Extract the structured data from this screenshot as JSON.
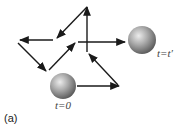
{
  "figure": {
    "panel_label": "(a)",
    "start_label": "t=0",
    "end_label": "t=t′",
    "colors": {
      "arrow": "#1a1a1a",
      "sphere_light": "#e6e6e6",
      "sphere_mid": "#a8a8a8",
      "sphere_dark": "#5a5a5a",
      "label": "#444444"
    },
    "start_sphere": {
      "cx": 63,
      "cy": 86,
      "r": 13
    },
    "end_sphere": {
      "cx": 142,
      "cy": 40,
      "r": 14
    },
    "path_segments": [
      {
        "from": [
          77,
          86
        ],
        "to": [
          119,
          86
        ]
      },
      {
        "from": [
          118,
          85
        ],
        "to": [
          89,
          54
        ]
      },
      {
        "from": [
          87,
          52
        ],
        "to": [
          87,
          7
        ]
      },
      {
        "from": [
          87,
          7
        ],
        "to": [
          57,
          38
        ]
      },
      {
        "from": [
          53,
          40
        ],
        "to": [
          20,
          40
        ]
      },
      {
        "from": [
          18,
          43
        ],
        "to": [
          46,
          71
        ]
      },
      {
        "from": [
          49,
          70
        ],
        "to": [
          75,
          43
        ]
      },
      {
        "from": [
          78,
          42
        ],
        "to": [
          125,
          42
        ]
      }
    ]
  }
}
